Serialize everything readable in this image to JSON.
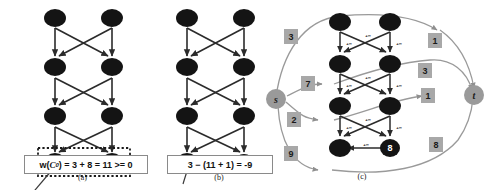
{
  "figure": {
    "background": "#ffffff",
    "node_fill": "#141414",
    "node_text": "#ffffff",
    "st_fill": "#9a9a9a",
    "box_fill": "#a8a8a8",
    "edge_color": "#2b2b2b",
    "curve_color": "#9a9a9a"
  },
  "panel_a": {
    "caption": "(a)",
    "equation": {
      "prefix": "w(",
      "symbol": "C",
      "subscript": "0",
      "suffix": ") = 3 + 8 = 11 >= 0",
      "full": "w(C0) = 3 + 8 = 11 >= 0"
    },
    "grid": {
      "rows": 4,
      "cols": 2,
      "labels": [
        [
          "",
          ""
        ],
        [
          "",
          ""
        ],
        [
          "",
          ""
        ],
        [
          "3",
          "8"
        ]
      ]
    },
    "highlight": {
      "style": "dotted-rectangle",
      "contains": [
        "3",
        "8"
      ]
    }
  },
  "panel_b": {
    "caption": "(b)",
    "equation": {
      "full": "3 − (11 + 1) = -9"
    },
    "grid": {
      "rows": 4,
      "cols": 2,
      "labels": [
        [
          "",
          ""
        ],
        [
          "",
          ""
        ],
        [
          "",
          ""
        ],
        [
          "",
          "8"
        ]
      ]
    }
  },
  "panel_c": {
    "caption": "(c)",
    "source_label": "s",
    "sink_label": "t",
    "edge_weight_label": "+∞",
    "grid": {
      "rows": 4,
      "cols": 2,
      "labels": [
        [
          "",
          ""
        ],
        [
          "",
          ""
        ],
        [
          "",
          ""
        ],
        [
          "",
          "8"
        ]
      ]
    },
    "source_weights": [
      "3",
      "7",
      "2",
      "9"
    ],
    "sink_weights": [
      "1",
      "3",
      "1",
      "8"
    ]
  }
}
